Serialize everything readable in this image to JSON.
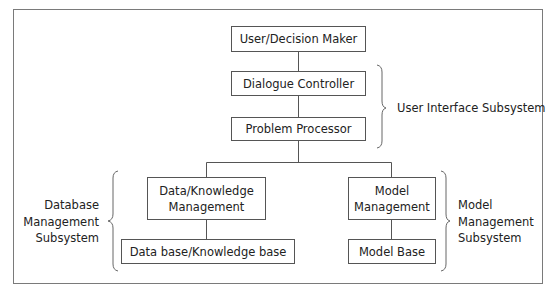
{
  "diagram": {
    "nodes": {
      "user": {
        "label": "User/Decision Maker"
      },
      "dialogue": {
        "label": "Dialogue Controller"
      },
      "problem": {
        "label": "Problem Processor"
      },
      "dkm": {
        "line1": "Data/Knowledge",
        "line2": "Management"
      },
      "dbkb": {
        "label": "Data base/Knowledge base"
      },
      "mm": {
        "line1": "Model",
        "line2": "Management"
      },
      "mb": {
        "label": "Model Base"
      }
    },
    "groups": {
      "ui": {
        "label": "User Interface Subsystem"
      },
      "dbms": {
        "line1": "Database",
        "line2": "Management",
        "line3": "Subsystem"
      },
      "mms": {
        "line1": "Model",
        "line2": "Management",
        "line3": "Subsystem"
      }
    },
    "edges": [
      [
        "user",
        "dialogue"
      ],
      [
        "dialogue",
        "problem"
      ],
      [
        "problem",
        "dkm"
      ],
      [
        "problem",
        "mm"
      ],
      [
        "dkm",
        "dbkb"
      ],
      [
        "mm",
        "mb"
      ]
    ],
    "colors": {
      "border": "#555555",
      "frame": "#7a7a7a",
      "text": "#222222"
    }
  }
}
